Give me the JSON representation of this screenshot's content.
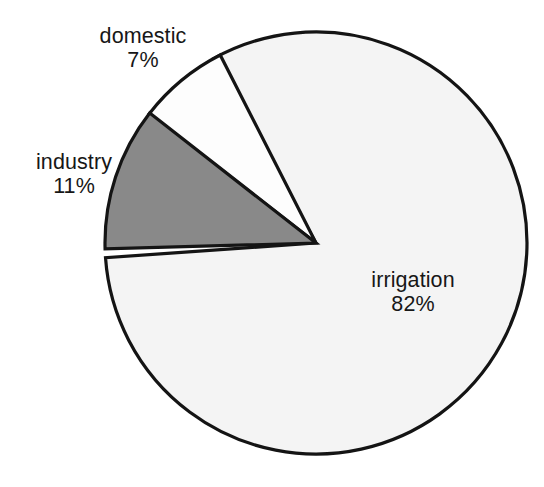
{
  "chart_data": {
    "type": "pie",
    "title": "",
    "subtitle": "",
    "xlabel": "",
    "ylabel": "",
    "legend_position": "none",
    "grid": false,
    "units": "percent",
    "total": 100,
    "categories": [
      "irrigation",
      "domestic",
      "industry"
    ],
    "values": [
      82,
      7,
      11
    ],
    "slices": [
      {
        "label": "irrigation",
        "value": 82,
        "value_label": "82%",
        "color": "#f4f4f4",
        "start_angle_deg": 184,
        "end_angle_deg": 117,
        "sweep_deg": 295.2
      },
      {
        "label": "domestic",
        "value": 7,
        "value_label": "7%",
        "color": "#fdfdfd",
        "start_angle_deg": 117,
        "end_angle_deg": 142,
        "sweep_deg": 25.2
      },
      {
        "label": "industry",
        "value": 11,
        "value_label": "11%",
        "color": "#898989",
        "start_angle_deg": 142,
        "end_angle_deg": 184,
        "sweep_deg": 39.6
      }
    ],
    "annotations": [
      {
        "text": "domestic",
        "value_text": "7%",
        "target": "domestic"
      },
      {
        "text": "industry",
        "value_text": "11%",
        "target": "industry"
      },
      {
        "text": "irrigation",
        "value_text": "82%",
        "target": "irrigation"
      }
    ],
    "geometry": {
      "center_x": 316,
      "center_y": 243,
      "radius": 211
    },
    "colors": {
      "background": "#ffffff",
      "outline": "#141414",
      "gray_slice": "#898989",
      "light_slice": "#f4f4f4",
      "white_slice": "#fdfdfd",
      "text": "#171717"
    }
  },
  "labels": {
    "domestic": {
      "name": "domestic",
      "value": "7%"
    },
    "industry": {
      "name": "industry",
      "value": "11%"
    },
    "irrigation": {
      "name": "irrigation",
      "value": "82%"
    }
  }
}
